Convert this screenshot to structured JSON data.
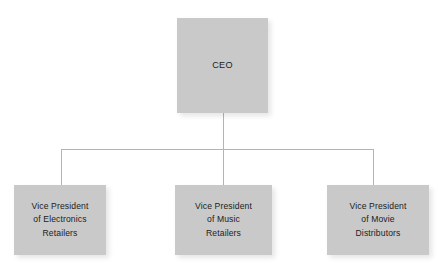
{
  "diagram": {
    "type": "organizational-chart",
    "title": "",
    "colors": {
      "node_fill": "#c9c9c9",
      "node_text": "#1c1c1c",
      "connector": "#b4b4b4",
      "background": "#ffffff"
    },
    "nodes": [
      {
        "id": "ceo",
        "label": "CEO",
        "level": 0
      },
      {
        "id": "vp-electronics",
        "label": "Vice President\nof Electronics\nRetailers",
        "level": 1
      },
      {
        "id": "vp-music",
        "label": "Vice President\nof Music\nRetailers",
        "level": 1
      },
      {
        "id": "vp-movie",
        "label": "Vice President\nof Movie\nDistributors",
        "level": 1
      }
    ],
    "edges": [
      {
        "from": "ceo",
        "to": "vp-electronics"
      },
      {
        "from": "ceo",
        "to": "vp-music"
      },
      {
        "from": "ceo",
        "to": "vp-movie"
      }
    ]
  }
}
